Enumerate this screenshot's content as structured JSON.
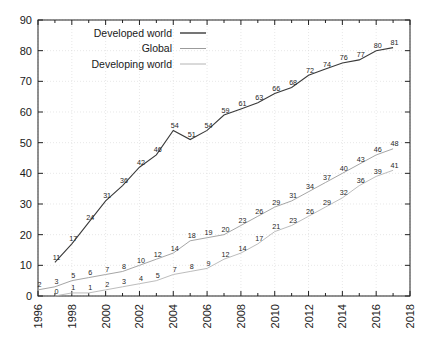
{
  "chart_data": {
    "type": "line",
    "title": "",
    "subtitle": "",
    "xlabel": "",
    "ylabel": "",
    "xlim": [
      1996,
      2018
    ],
    "ylim": [
      0,
      90
    ],
    "grid": true,
    "legend_position": "top-left",
    "x_ticks": [
      "1996",
      "1998",
      "2000",
      "2002",
      "2004",
      "2006",
      "2008",
      "2010",
      "2012",
      "2014",
      "2016",
      "2018"
    ],
    "y_ticks": [
      "0",
      "10",
      "20",
      "30",
      "40",
      "50",
      "60",
      "70",
      "80",
      "90"
    ],
    "x": [
      1997,
      1998,
      1999,
      2000,
      2001,
      2002,
      2003,
      2004,
      2005,
      2006,
      2007,
      2008,
      2009,
      2010,
      2011,
      2012,
      2013,
      2014,
      2015,
      2016,
      2017
    ],
    "series": [
      {
        "name": "Developed world",
        "color": "#3a3a3a",
        "x": [
          1997,
          1998,
          1999,
          2000,
          2001,
          2002,
          2003,
          2004,
          2005,
          2006,
          2007,
          2008,
          2009,
          2010,
          2011,
          2012,
          2013,
          2014,
          2015,
          2016,
          2017
        ],
        "values": [
          11,
          17,
          24,
          31,
          36,
          42,
          46,
          54,
          51,
          54,
          59,
          61,
          63,
          66,
          68,
          72,
          74,
          76,
          77,
          80,
          81
        ]
      },
      {
        "name": "Global",
        "color": "#9b9b9b",
        "x": [
          1996,
          1997,
          1998,
          1999,
          2000,
          2001,
          2002,
          2003,
          2004,
          2005,
          2006,
          2007,
          2008,
          2009,
          2010,
          2011,
          2012,
          2013,
          2014,
          2015,
          2016,
          2017
        ],
        "values": [
          2,
          3,
          5,
          6,
          7,
          8,
          10,
          12,
          14,
          18,
          19,
          20,
          23,
          26,
          29,
          31,
          34,
          37,
          40,
          43,
          46,
          48
        ]
      },
      {
        "name": "Developing world",
        "color": "#b4b4b4",
        "x": [
          1997,
          1998,
          1999,
          2000,
          2001,
          2002,
          2003,
          2004,
          2005,
          2006,
          2007,
          2008,
          2009,
          2010,
          2011,
          2012,
          2013,
          2014,
          2015,
          2016,
          2017
        ],
        "values": [
          0,
          1,
          1,
          2,
          3,
          4,
          5,
          7,
          8,
          9,
          12,
          14,
          17,
          21,
          23,
          26,
          29,
          32,
          36,
          39,
          41
        ]
      }
    ],
    "legend": [
      {
        "label": "Developed world",
        "color": "#3a3a3a"
      },
      {
        "label": "Global",
        "color": "#9b9b9b"
      },
      {
        "label": "Developing world",
        "color": "#b4b4b4"
      }
    ]
  }
}
